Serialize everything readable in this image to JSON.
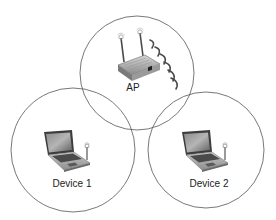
{
  "diagram": {
    "type": "wireless-network-coverage",
    "nodes": [
      {
        "id": "ap",
        "label": "AP",
        "icon": "wireless-router-icon",
        "coverage_circle": {
          "cx": 137,
          "cy": 73,
          "r": 57
        },
        "label_pos": {
          "x": 133,
          "y": 82
        }
      },
      {
        "id": "device1",
        "label": "Device 1",
        "icon": "laptop-icon",
        "coverage_circle": {
          "cx": 73,
          "cy": 150,
          "r": 62
        },
        "label_pos": {
          "x": 72,
          "y": 178
        }
      },
      {
        "id": "device2",
        "label": "Device 2",
        "icon": "laptop-icon",
        "coverage_circle": {
          "cx": 206,
          "cy": 150,
          "r": 58
        },
        "label_pos": {
          "x": 209,
          "y": 178
        }
      }
    ],
    "colors": {
      "circle_stroke": "#555555",
      "label_text": "#222222",
      "device_body": "#9a9a9a",
      "screen": "#6b6b6b",
      "signal_wave": "#4a4a4a"
    }
  }
}
